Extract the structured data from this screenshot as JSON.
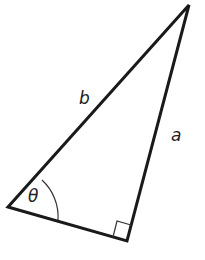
{
  "figure": {
    "type": "right-triangle",
    "labels": {
      "hypotenuse": "b",
      "side": "a",
      "angle": "θ"
    },
    "stroke_color": "#1a1a1a",
    "right_angle_marker": true
  }
}
